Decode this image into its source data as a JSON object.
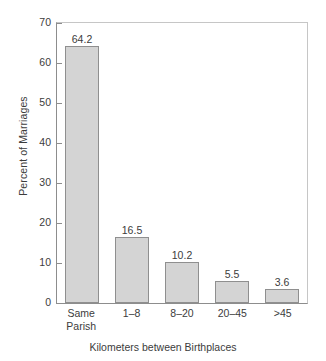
{
  "chart_data": {
    "type": "bar",
    "title": "",
    "categories": [
      "Same Parish",
      "1–8",
      "8–20",
      "20–45",
      ">45"
    ],
    "category_lines": [
      [
        "Same",
        "Parish"
      ],
      [
        "1–8"
      ],
      [
        "8–20"
      ],
      [
        "20–45"
      ],
      [
        ">45"
      ]
    ],
    "values": [
      64.2,
      16.5,
      10.2,
      5.5,
      3.6
    ],
    "value_labels": [
      "64.2",
      "16.5",
      "10.2",
      "5.5",
      "3.6"
    ],
    "xlabel": "Kilometers between Birthplaces",
    "ylabel": "Percent of Marriages",
    "ylim": [
      0,
      70
    ],
    "ytick_values": [
      0,
      10,
      20,
      30,
      40,
      50,
      60,
      70
    ],
    "ytick_labels": [
      "0",
      "10",
      "20",
      "30",
      "40",
      "50",
      "60",
      "70"
    ],
    "grid": false,
    "legend": null,
    "bar_color": "#d4d4d4",
    "bar_border_color": "#8f8f8f",
    "axis_color": "#8d8d8d",
    "text_color": "#3c3c3c",
    "background": "#ffffff"
  }
}
